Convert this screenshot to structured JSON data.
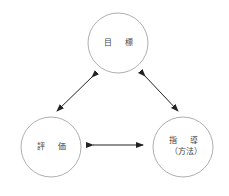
{
  "diagram": {
    "nodes": [
      {
        "id": "goal",
        "lines": [
          "目 標"
        ],
        "cx": 118,
        "cy": 43,
        "r": 30
      },
      {
        "id": "evaluation",
        "lines": [
          "評 価"
        ],
        "cx": 51,
        "cy": 147,
        "r": 30
      },
      {
        "id": "instruction",
        "lines": [
          "指 導",
          "（方法）"
        ],
        "cx": 183,
        "cy": 147,
        "r": 30
      }
    ],
    "edges": [
      {
        "from": "goal",
        "to": "evaluation",
        "type": "bidirectional"
      },
      {
        "from": "goal",
        "to": "instruction",
        "type": "bidirectional"
      },
      {
        "from": "evaluation",
        "to": "instruction",
        "type": "bidirectional"
      }
    ],
    "colors": {
      "stroke": "#999999",
      "arrow": "#222222",
      "text": "#444444"
    }
  }
}
